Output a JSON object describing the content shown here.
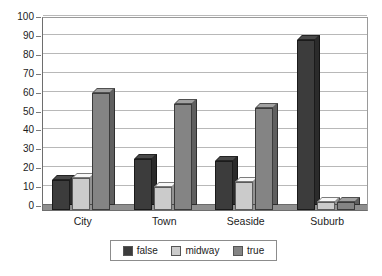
{
  "chart_data": {
    "type": "bar",
    "title": "",
    "subtitle": "",
    "xlabel": "",
    "ylabel": "",
    "categories": [
      "City",
      "Town",
      "Seaside",
      "Suburb"
    ],
    "series": [
      {
        "name": "false",
        "color": "#3c3c3c",
        "values": [
          16,
          27,
          26,
          90
        ]
      },
      {
        "name": "midway",
        "color": "#cbcbcb",
        "values": [
          17,
          12,
          15,
          4
        ]
      },
      {
        "name": "true",
        "color": "#848484",
        "values": [
          62,
          56,
          54,
          4
        ]
      }
    ],
    "ylim": [
      0,
      100
    ],
    "ytick_step": 10,
    "yticks": [
      0,
      10,
      20,
      30,
      40,
      50,
      60,
      70,
      80,
      90,
      100
    ],
    "ytick_labels": [
      "0",
      "10",
      "20",
      "30",
      "40",
      "50",
      "60",
      "70",
      "80",
      "90",
      "100"
    ],
    "grid": true,
    "grid_axis": "y",
    "legend_position": "bottom",
    "style": "3d-bar",
    "plot_background": "#ffffff",
    "grid_color": "#b8b8b8",
    "axis_color": "#6e6e6e"
  }
}
